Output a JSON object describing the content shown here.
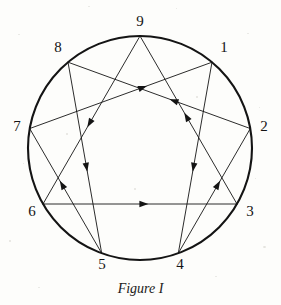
{
  "figure": {
    "caption": "Figure I",
    "type": "enneagram-diagram",
    "ink_color": "#141414",
    "background_color": "#fdfdfb",
    "circle": {
      "cx": 140,
      "cy": 148,
      "r": 112,
      "stroke_width": 2.1
    },
    "line_stroke_width": 0.9,
    "points": [
      {
        "id": "9",
        "label": "9",
        "angle_deg": -90,
        "label_x": 140,
        "label_y": 22
      },
      {
        "id": "1",
        "label": "1",
        "angle_deg": -50,
        "label_x": 224,
        "label_y": 48
      },
      {
        "id": "2",
        "label": "2",
        "angle_deg": -10,
        "label_x": 264,
        "label_y": 127
      },
      {
        "id": "3",
        "label": "3",
        "angle_deg": 30,
        "label_x": 250,
        "label_y": 212
      },
      {
        "id": "4",
        "label": "4",
        "angle_deg": 70,
        "label_x": 180,
        "label_y": 265
      },
      {
        "id": "5",
        "label": "5",
        "angle_deg": 110,
        "label_x": 102,
        "label_y": 265
      },
      {
        "id": "6",
        "label": "6",
        "angle_deg": 150,
        "label_x": 32,
        "label_y": 212
      },
      {
        "id": "7",
        "label": "7",
        "angle_deg": 190,
        "label_x": 17,
        "label_y": 127
      },
      {
        "id": "8",
        "label": "8",
        "angle_deg": 230,
        "label_x": 58,
        "label_y": 48
      }
    ],
    "triangle_cycle": {
      "name": "inner-triangle",
      "sequence": [
        "9",
        "6",
        "3",
        "9"
      ],
      "segments": [
        {
          "from": "9",
          "to": "6",
          "arrow_at": 0.52
        },
        {
          "from": "6",
          "to": "3",
          "arrow_at": 0.52
        },
        {
          "from": "3",
          "to": "9",
          "arrow_at": 0.52
        }
      ]
    },
    "hexad_cycle": {
      "name": "hexad-periodic-figure",
      "sequence": [
        "1",
        "4",
        "2",
        "8",
        "5",
        "7",
        "1"
      ],
      "segments": [
        {
          "from": "1",
          "to": "4",
          "arrow_at": 0.55
        },
        {
          "from": "4",
          "to": "2",
          "arrow_at": 0.55
        },
        {
          "from": "2",
          "to": "8",
          "arrow_at": 0.42
        },
        {
          "from": "8",
          "to": "5",
          "arrow_at": 0.55
        },
        {
          "from": "5",
          "to": "7",
          "arrow_at": 0.55
        },
        {
          "from": "7",
          "to": "1",
          "arrow_at": 0.62
        }
      ]
    }
  }
}
